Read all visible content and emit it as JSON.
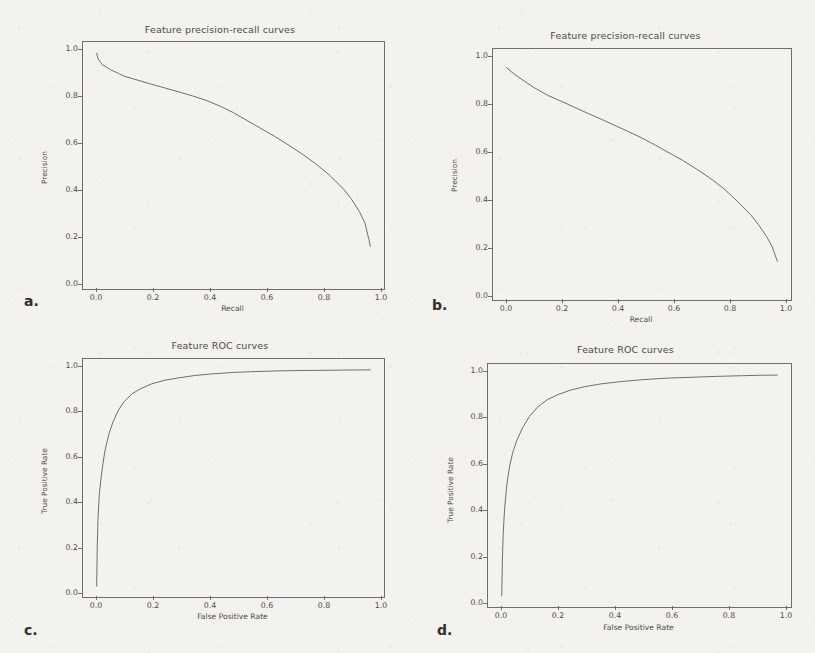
{
  "figure": {
    "background_color": "#f4f2ee",
    "ink_color": "#6e6e6e",
    "panels": [
      {
        "letter": "a.",
        "title": "Feature precision-recall curves",
        "xlabel": "Recall",
        "ylabel": "Precision",
        "xticks": [
          "0.0",
          "0.2",
          "0.4",
          "0.6",
          "0.8",
          "1.0"
        ],
        "yticks": [
          "0.0",
          "0.2",
          "0.4",
          "0.6",
          "0.8",
          "1.0"
        ]
      },
      {
        "letter": "b.",
        "title": "Feature precision-recall curves",
        "xlabel": "Recall",
        "ylabel": "Precision",
        "xticks": [
          "0.0",
          "0.2",
          "0.4",
          "0.6",
          "0.8",
          "1.0"
        ],
        "yticks": [
          "0.0",
          "0.2",
          "0.4",
          "0.6",
          "0.8",
          "1.0"
        ]
      },
      {
        "letter": "c.",
        "title": "Feature ROC curves",
        "xlabel": "False Positive Rate",
        "ylabel": "True Positive Rate",
        "xticks": [
          "0.0",
          "0.2",
          "0.4",
          "0.6",
          "0.8",
          "1.0"
        ],
        "yticks": [
          "0.0",
          "0.2",
          "0.4",
          "0.6",
          "0.8",
          "1.0"
        ]
      },
      {
        "letter": "d.",
        "title": "Feature ROC curves",
        "xlabel": "False Positive Rate",
        "ylabel": "True Positive Rate",
        "xticks": [
          "0.0",
          "0.2",
          "0.4",
          "0.6",
          "0.8",
          "1.0"
        ],
        "yticks": [
          "0.0",
          "0.2",
          "0.4",
          "0.6",
          "0.8",
          "1.0"
        ]
      }
    ]
  },
  "chart_data": [
    {
      "type": "line",
      "panel": "a",
      "title": "Feature precision-recall curves",
      "xlabel": "Recall",
      "ylabel": "Precision",
      "xlim": [
        -0.05,
        1.05
      ],
      "ylim": [
        -0.05,
        1.05
      ],
      "grid": false,
      "legend": "none",
      "series": [
        {
          "name": "precision-recall",
          "x": [
            0.0,
            0.005,
            0.02,
            0.05,
            0.08,
            0.1,
            0.15,
            0.2,
            0.25,
            0.3,
            0.35,
            0.4,
            0.45,
            0.5,
            0.55,
            0.6,
            0.65,
            0.7,
            0.75,
            0.8,
            0.85,
            0.9,
            0.93,
            0.96,
            0.98,
            0.995,
            1.0
          ],
          "y": [
            1.0,
            0.975,
            0.95,
            0.927,
            0.91,
            0.898,
            0.88,
            0.862,
            0.845,
            0.828,
            0.81,
            0.79,
            0.765,
            0.735,
            0.7,
            0.665,
            0.63,
            0.592,
            0.552,
            0.508,
            0.458,
            0.398,
            0.352,
            0.295,
            0.245,
            0.17,
            0.14
          ]
        }
      ]
    },
    {
      "type": "line",
      "panel": "b",
      "title": "Feature precision-recall curves",
      "xlabel": "Recall",
      "ylabel": "Precision",
      "xlim": [
        -0.05,
        1.05
      ],
      "ylim": [
        -0.05,
        1.05
      ],
      "grid": false,
      "legend": "none",
      "series": [
        {
          "name": "precision-recall",
          "x": [
            0.0,
            0.02,
            0.05,
            0.1,
            0.15,
            0.2,
            0.25,
            0.3,
            0.35,
            0.4,
            0.45,
            0.5,
            0.55,
            0.6,
            0.65,
            0.7,
            0.75,
            0.8,
            0.85,
            0.9,
            0.93,
            0.96,
            0.98,
            0.995,
            1.0
          ],
          "y": [
            0.968,
            0.948,
            0.922,
            0.882,
            0.848,
            0.822,
            0.795,
            0.768,
            0.742,
            0.715,
            0.688,
            0.66,
            0.628,
            0.595,
            0.562,
            0.525,
            0.485,
            0.44,
            0.385,
            0.325,
            0.28,
            0.228,
            0.185,
            0.135,
            0.12
          ]
        }
      ]
    },
    {
      "type": "line",
      "panel": "c",
      "title": "Feature ROC curves",
      "xlabel": "False Positive Rate",
      "ylabel": "True Positive Rate",
      "xlim": [
        -0.05,
        1.05
      ],
      "ylim": [
        -0.05,
        1.05
      ],
      "grid": false,
      "legend": "none",
      "series": [
        {
          "name": "roc",
          "x": [
            0.0,
            0.002,
            0.005,
            0.01,
            0.015,
            0.02,
            0.03,
            0.045,
            0.06,
            0.08,
            0.1,
            0.13,
            0.16,
            0.2,
            0.25,
            0.3,
            0.36,
            0.42,
            0.5,
            0.58,
            0.66,
            0.75,
            0.85,
            0.93,
            1.0
          ],
          "y": [
            0.0,
            0.18,
            0.32,
            0.43,
            0.49,
            0.54,
            0.625,
            0.705,
            0.76,
            0.815,
            0.852,
            0.89,
            0.912,
            0.935,
            0.952,
            0.963,
            0.974,
            0.981,
            0.988,
            0.992,
            0.995,
            0.997,
            0.998,
            0.999,
            1.0
          ]
        }
      ]
    },
    {
      "type": "line",
      "panel": "d",
      "title": "Feature ROC curves",
      "xlabel": "False Positive Rate",
      "ylabel": "True Positive Rate",
      "xlim": [
        -0.05,
        1.05
      ],
      "ylim": [
        -0.05,
        1.05
      ],
      "grid": false,
      "legend": "none",
      "series": [
        {
          "name": "roc",
          "x": [
            0.0,
            0.002,
            0.005,
            0.01,
            0.018,
            0.028,
            0.04,
            0.055,
            0.075,
            0.1,
            0.13,
            0.165,
            0.205,
            0.25,
            0.3,
            0.36,
            0.43,
            0.51,
            0.6,
            0.69,
            0.78,
            0.87,
            0.94,
            1.0
          ],
          "y": [
            0.0,
            0.15,
            0.275,
            0.39,
            0.5,
            0.585,
            0.65,
            0.705,
            0.76,
            0.812,
            0.855,
            0.888,
            0.912,
            0.932,
            0.947,
            0.96,
            0.97,
            0.979,
            0.986,
            0.99,
            0.994,
            0.997,
            0.999,
            1.0
          ]
        }
      ]
    }
  ]
}
